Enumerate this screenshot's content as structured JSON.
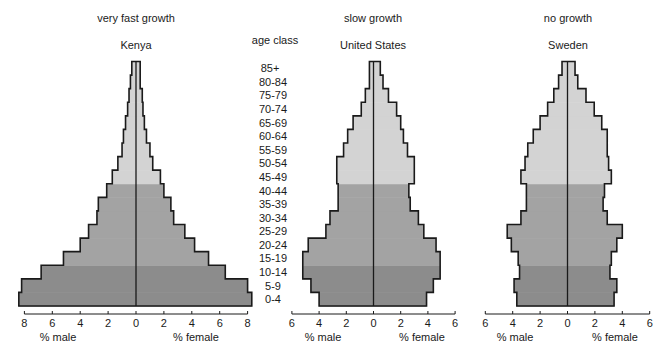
{
  "colors": {
    "young": "#8c8c8c",
    "middle": "#a3a3a3",
    "old": "#d3d3d3",
    "outline": "#1a1a1a",
    "background": "#ffffff"
  },
  "age_axis": {
    "title": "age class",
    "labels": [
      "0-4",
      "5-9",
      "10-14",
      "15-19",
      "20-24",
      "25-29",
      "30-34",
      "35-39",
      "40-44",
      "45-49",
      "50-54",
      "55-59",
      "60-64",
      "65-69",
      "70-74",
      "75-79",
      "80-84",
      "85+"
    ]
  },
  "chart_data": [
    {
      "type": "bar",
      "subtype": "population-pyramid",
      "title": "very fast growth",
      "subtitle": "Kenya",
      "xlabel_left": "% male",
      "xlabel_right": "% female",
      "xlim": [
        -8,
        8
      ],
      "xticks": [
        8,
        6,
        4,
        2,
        0,
        2,
        4,
        6,
        8
      ],
      "categories": [
        "0-4",
        "5-9",
        "10-14",
        "15-19",
        "20-24",
        "25-29",
        "30-34",
        "35-39",
        "40-44",
        "45-49",
        "50-54",
        "55-59",
        "60-64",
        "65-69",
        "70-74",
        "75-79",
        "80-84",
        "85+"
      ],
      "series": [
        {
          "name": "% male",
          "values": [
            8.4,
            8.2,
            6.8,
            5.2,
            4.0,
            3.4,
            2.8,
            2.7,
            2.1,
            1.7,
            1.3,
            1.0,
            0.9,
            0.75,
            0.6,
            0.5,
            0.4,
            0.3
          ]
        },
        {
          "name": "% female",
          "values": [
            8.3,
            8.0,
            6.4,
            5.2,
            4.2,
            3.5,
            2.7,
            2.5,
            2.0,
            1.75,
            1.2,
            1.0,
            0.75,
            0.6,
            0.5,
            0.45,
            0.3,
            0.3
          ]
        }
      ],
      "shading": {
        "young": "0-14",
        "middle": "15-44",
        "old": "45+"
      },
      "grid": false,
      "legend": "none"
    },
    {
      "type": "bar",
      "subtype": "population-pyramid",
      "title": "slow growth",
      "subtitle": "United States",
      "xlabel_left": "% male",
      "xlabel_right": "% female",
      "xlim": [
        -6,
        6
      ],
      "xticks": [
        6,
        4,
        2,
        0,
        2,
        4,
        6
      ],
      "categories": [
        "0-4",
        "5-9",
        "10-14",
        "15-19",
        "20-24",
        "25-29",
        "30-34",
        "35-39",
        "40-44",
        "45-49",
        "50-54",
        "55-59",
        "60-64",
        "65-69",
        "70-74",
        "75-79",
        "80-84",
        "85+"
      ],
      "series": [
        {
          "name": "% male",
          "values": [
            4.0,
            4.6,
            5.2,
            5.2,
            4.8,
            3.5,
            3.2,
            2.6,
            2.6,
            2.7,
            2.7,
            2.2,
            1.9,
            1.5,
            0.9,
            0.6,
            0.3,
            0.3
          ]
        },
        {
          "name": "% female",
          "values": [
            3.9,
            4.4,
            4.9,
            4.9,
            4.6,
            3.7,
            3.3,
            2.7,
            2.6,
            3.0,
            3.0,
            2.5,
            2.2,
            2.0,
            1.7,
            1.1,
            0.7,
            0.5
          ]
        }
      ],
      "shading": {
        "young": "0-14",
        "middle": "15-44",
        "old": "45+"
      },
      "grid": false,
      "legend": "none"
    },
    {
      "type": "bar",
      "subtype": "population-pyramid",
      "title": "no growth",
      "subtitle": "Sweden",
      "xlabel_left": "% male",
      "xlabel_right": "% female",
      "xlim": [
        -6,
        6
      ],
      "xticks": [
        6,
        4,
        2,
        0,
        2,
        4,
        6
      ],
      "categories": [
        "0-4",
        "5-9",
        "10-14",
        "15-19",
        "20-24",
        "25-29",
        "30-34",
        "35-39",
        "40-44",
        "45-49",
        "50-54",
        "55-59",
        "60-64",
        "65-69",
        "70-74",
        "75-79",
        "80-84",
        "85+"
      ],
      "series": [
        {
          "name": "% male",
          "values": [
            3.7,
            3.9,
            3.5,
            3.6,
            4.1,
            4.4,
            3.4,
            3.0,
            3.0,
            3.4,
            3.1,
            2.9,
            2.5,
            2.0,
            1.45,
            1.0,
            0.65,
            0.4
          ]
        },
        {
          "name": "% female",
          "values": [
            3.4,
            3.6,
            3.1,
            3.2,
            3.6,
            4.0,
            2.9,
            2.6,
            2.7,
            3.2,
            3.0,
            2.9,
            2.9,
            2.5,
            1.95,
            1.35,
            0.75,
            0.55
          ]
        }
      ],
      "shading": {
        "young": "0-14",
        "middle": "15-44",
        "old": "45+"
      },
      "grid": false,
      "legend": "none"
    }
  ]
}
